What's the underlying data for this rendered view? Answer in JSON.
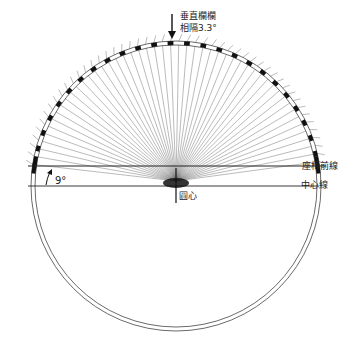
{
  "labels": {
    "vertical_rails": "垂直欄欄",
    "spacing": "相隔3.3°",
    "seat_front_line": "座椅前線",
    "center_line": "中心線",
    "circle_center": "圓心",
    "angle": "9°"
  },
  "geometry": {
    "cx": 176,
    "cy": 186,
    "outer_radius": 145,
    "inner_radius": 141,
    "spoke_spacing_deg": 3.3,
    "seat_line_angle_deg": 9
  },
  "colors": {
    "line": "#333333",
    "spoke": "#555555",
    "block": "#111111"
  }
}
